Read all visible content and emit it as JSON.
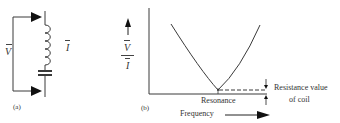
{
  "figure": {
    "panel_a": {
      "label": "(a)",
      "voltage_symbol": "V",
      "current_symbol": "I",
      "components": [
        "inductor-coil",
        "capacitor"
      ]
    },
    "panel_b": {
      "label": "(b)",
      "y_axis_numerator": "V",
      "y_axis_denominator": "I",
      "x_axis_label": "Frequency",
      "resonance_label": "Resonance",
      "annotation_line1": "Resistance value",
      "annotation_line2": "of coil"
    }
  },
  "colors": {
    "line": "#3a3a3a",
    "text": "#333333",
    "background": "#ffffff"
  }
}
